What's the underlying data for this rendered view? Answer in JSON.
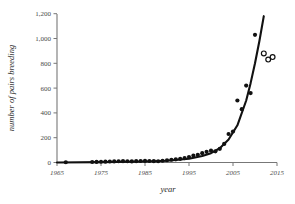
{
  "chart_data": {
    "type": "scatter",
    "title": "",
    "subtitle": "",
    "xlabel": "year",
    "ylabel": "number of pairs breeding",
    "xlim": [
      1965,
      2015
    ],
    "ylim": [
      0,
      1200
    ],
    "grid": false,
    "legend_position": "none",
    "xticks": [
      "1965",
      "1975",
      "1985",
      "1995",
      "2005",
      "2015"
    ],
    "xtick_values": [
      1965,
      1975,
      1985,
      1995,
      2005,
      2015
    ],
    "yticks": [
      "0",
      "200",
      "400",
      "600",
      "800",
      "1,000",
      "1,200"
    ],
    "ytick_values": [
      0,
      200,
      400,
      600,
      800,
      1000,
      1200
    ],
    "series": [
      {
        "name": "observed pairs breeding",
        "marker": "filled-circle",
        "x": [
          1967,
          1973,
          1974,
          1975,
          1976,
          1977,
          1978,
          1979,
          1980,
          1981,
          1982,
          1983,
          1984,
          1985,
          1986,
          1987,
          1988,
          1989,
          1990,
          1991,
          1992,
          1993,
          1994,
          1995,
          1996,
          1997,
          1998,
          1999,
          2000,
          2001,
          2002,
          2003,
          2004,
          2005,
          2006,
          2007,
          2008,
          2009,
          2010
        ],
        "values": [
          2,
          4,
          5,
          6,
          7,
          8,
          9,
          10,
          11,
          10,
          9,
          11,
          12,
          13,
          12,
          11,
          10,
          14,
          18,
          22,
          26,
          30,
          36,
          44,
          55,
          62,
          75,
          86,
          95,
          90,
          110,
          150,
          230,
          250,
          500,
          430,
          620,
          560,
          1030
        ]
      },
      {
        "name": "projected / unconfirmed counts",
        "marker": "open-circle",
        "x": [
          2012,
          2013,
          2014
        ],
        "values": [
          880,
          830,
          850
        ]
      }
    ],
    "fit_curve": {
      "name": "exponential fit",
      "style": "solid-black-line",
      "x": [
        1965,
        1975,
        1985,
        1990,
        1995,
        1998,
        2000,
        2002,
        2004,
        2006,
        2008,
        2009,
        2010,
        2011,
        2012
      ],
      "values": [
        0,
        3,
        8,
        14,
        30,
        52,
        75,
        115,
        185,
        300,
        500,
        640,
        800,
        980,
        1180
      ]
    }
  }
}
